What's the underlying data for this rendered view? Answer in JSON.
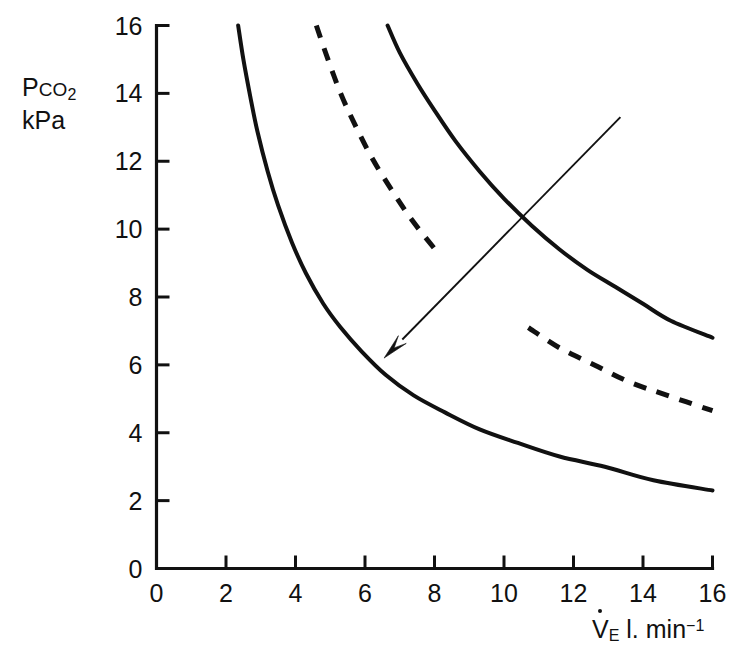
{
  "chart_data": {
    "type": "line",
    "title": "",
    "subtitle": "",
    "xlabel": "V̇E l. min⁻¹",
    "ylabel": "Pco2 kPa",
    "xlim": [
      0,
      16
    ],
    "ylim": [
      0,
      16
    ],
    "grid": false,
    "legend": "none",
    "x_ticks": [
      0,
      2,
      4,
      6,
      8,
      10,
      12,
      14,
      16
    ],
    "y_ticks": [
      0,
      2,
      4,
      6,
      8,
      10,
      12,
      14,
      16
    ],
    "x_tick_labels": [
      "0",
      "2",
      "4",
      "6",
      "8",
      "10",
      "12",
      "14",
      "16"
    ],
    "y_tick_labels": [
      "0",
      "2",
      "4",
      "6",
      "8",
      "10",
      "12",
      "14",
      "16"
    ],
    "series": [
      {
        "name": "left-curve",
        "style": "solid",
        "color": "#111111",
        "points": [
          [
            2.35,
            16.0
          ],
          [
            2.5,
            15.0
          ],
          [
            2.7,
            13.9
          ],
          [
            2.9,
            12.9
          ],
          [
            3.2,
            11.7
          ],
          [
            3.5,
            10.7
          ],
          [
            3.9,
            9.6
          ],
          [
            4.3,
            8.7
          ],
          [
            4.8,
            7.8
          ],
          [
            5.3,
            7.1
          ],
          [
            5.9,
            6.4
          ],
          [
            6.6,
            5.7
          ],
          [
            7.4,
            5.1
          ],
          [
            8.3,
            4.6
          ],
          [
            9.3,
            4.1
          ],
          [
            10.4,
            3.7
          ],
          [
            11.6,
            3.3
          ],
          [
            12.9,
            3.0
          ],
          [
            14.3,
            2.6
          ],
          [
            16.0,
            2.3
          ]
        ]
      },
      {
        "name": "middle-curve-dashed",
        "style": "dashed",
        "color": "#111111",
        "gap_y_range": [
          7.5,
          8.6
        ],
        "points": [
          [
            4.6,
            16.0
          ],
          [
            4.9,
            15.1
          ],
          [
            5.3,
            14.0
          ],
          [
            5.7,
            13.1
          ],
          [
            6.2,
            12.1
          ],
          [
            6.8,
            11.1
          ],
          [
            7.4,
            10.2
          ],
          [
            8.1,
            9.3
          ],
          [
            8.9,
            8.5
          ],
          [
            9.8,
            7.7
          ],
          [
            10.7,
            7.1
          ],
          [
            11.6,
            6.5
          ],
          [
            12.6,
            6.0
          ],
          [
            13.6,
            5.5
          ],
          [
            14.7,
            5.1
          ],
          [
            16.0,
            4.65
          ]
        ]
      },
      {
        "name": "right-curve",
        "style": "solid",
        "color": "#111111",
        "points": [
          [
            6.65,
            16.0
          ],
          [
            7.0,
            15.2
          ],
          [
            7.5,
            14.3
          ],
          [
            8.0,
            13.5
          ],
          [
            8.6,
            12.6
          ],
          [
            9.3,
            11.7
          ],
          [
            10.0,
            10.9
          ],
          [
            10.8,
            10.1
          ],
          [
            11.6,
            9.4
          ],
          [
            12.4,
            8.8
          ],
          [
            13.2,
            8.3
          ],
          [
            14.0,
            7.8
          ],
          [
            14.8,
            7.3
          ],
          [
            16.0,
            6.8
          ]
        ]
      }
    ],
    "annotations": [
      {
        "name": "shift-arrow",
        "type": "arrow",
        "from": [
          13.35,
          13.3
        ],
        "to": [
          6.55,
          6.2
        ],
        "color": "#111111"
      }
    ]
  },
  "axes": {
    "y_title_line1_prefix": "P",
    "y_title_line1_smallcaps": "CO",
    "y_title_line1_sub": "2",
    "y_title_line2": "kPa",
    "x_title_v": "V",
    "x_title_sub": "E",
    "x_title_unit": " l. min",
    "x_title_sup": "−1"
  }
}
